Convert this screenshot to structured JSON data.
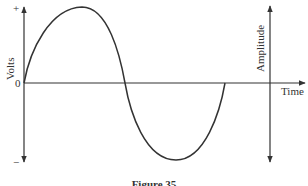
{
  "figure": {
    "caption": "Figure 35",
    "left_axis": {
      "label": "Volts",
      "top_marker": "+",
      "zero_marker": "0",
      "bottom_marker": "−"
    },
    "right_axis": {
      "label": "Amplitude"
    },
    "horizontal_axis": {
      "label": "Time"
    },
    "curve": {
      "type": "sine",
      "cycles": 1,
      "description": "one full cycle of a sine wave, starting at zero, positive half first"
    },
    "colors": {
      "line": "#333333",
      "background": "#ffffff"
    }
  }
}
